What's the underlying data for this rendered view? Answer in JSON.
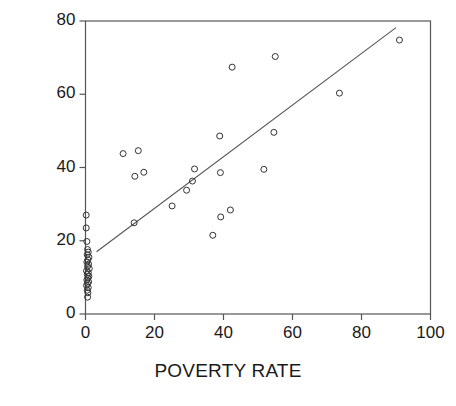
{
  "chart_data": {
    "type": "scatter",
    "title": "",
    "xlabel": "POVERTY RATE",
    "ylabel": "INFORMAL SHARE",
    "xlim": [
      0,
      100
    ],
    "ylim": [
      0,
      80
    ],
    "xticks": [
      0,
      20,
      40,
      60,
      80,
      100
    ],
    "yticks": [
      0,
      20,
      40,
      60,
      80
    ],
    "xtick_labels": [
      "0",
      "20",
      "40",
      "60",
      "80",
      "100"
    ],
    "ytick_labels": [
      "0",
      "20",
      "40",
      "60",
      "80"
    ],
    "grid": false,
    "legend": null,
    "marker": "open-circle",
    "marker_color": "#333333",
    "line_color": "#555555",
    "axis_color": "#555555",
    "points": [
      [
        0.2,
        27.0
      ],
      [
        0.2,
        23.5
      ],
      [
        0.4,
        19.8
      ],
      [
        0.6,
        17.6
      ],
      [
        0.8,
        16.9
      ],
      [
        0.5,
        16.2
      ],
      [
        1.0,
        15.5
      ],
      [
        0.7,
        14.8
      ],
      [
        0.4,
        14.2
      ],
      [
        0.9,
        13.6
      ],
      [
        0.6,
        13.0
      ],
      [
        1.1,
        12.4
      ],
      [
        0.3,
        11.8
      ],
      [
        0.8,
        11.3
      ],
      [
        0.5,
        10.8
      ],
      [
        1.0,
        10.3
      ],
      [
        0.7,
        9.8
      ],
      [
        0.4,
        9.3
      ],
      [
        0.9,
        8.8
      ],
      [
        0.6,
        8.3
      ],
      [
        0.3,
        7.8
      ],
      [
        0.8,
        7.2
      ],
      [
        0.5,
        6.5
      ],
      [
        0.7,
        5.8
      ],
      [
        0.6,
        4.6
      ],
      [
        10.9,
        43.8
      ],
      [
        14.3,
        37.6
      ],
      [
        15.3,
        44.6
      ],
      [
        14.1,
        24.9
      ],
      [
        16.9,
        38.7
      ],
      [
        25.1,
        29.5
      ],
      [
        29.3,
        33.8
      ],
      [
        31.0,
        36.3
      ],
      [
        31.6,
        39.6
      ],
      [
        36.9,
        21.5
      ],
      [
        38.9,
        48.6
      ],
      [
        39.2,
        26.5
      ],
      [
        39.1,
        38.6
      ],
      [
        42.0,
        28.4
      ],
      [
        42.5,
        67.4
      ],
      [
        51.7,
        39.5
      ],
      [
        54.6,
        49.6
      ],
      [
        55.0,
        70.3
      ],
      [
        73.6,
        60.3
      ],
      [
        91.0,
        74.8
      ]
    ],
    "trend_line": {
      "type": "fit-line",
      "x_start": 3.2,
      "y_start": 17.0,
      "x_end": 90.0,
      "y_end": 78.2
    }
  }
}
